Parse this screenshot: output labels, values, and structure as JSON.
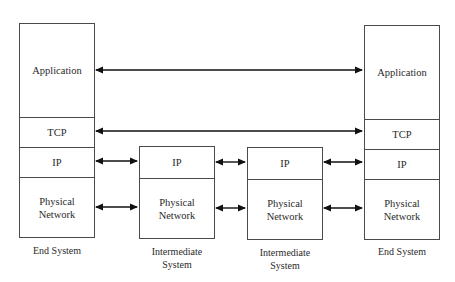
{
  "diagram": {
    "type": "protocol-stack",
    "systems": [
      {
        "id": "end-system-left",
        "label": "End System",
        "layers": [
          "Application",
          "TCP",
          "IP",
          "Physical Network"
        ]
      },
      {
        "id": "intermediate-system-1",
        "label": "Intermediate System",
        "layers": [
          "IP",
          "Physical Network"
        ]
      },
      {
        "id": "intermediate-system-2",
        "label": "Intermediate System",
        "layers": [
          "IP",
          "Physical Network"
        ]
      },
      {
        "id": "end-system-right",
        "label": "End System",
        "layers": [
          "Application",
          "TCP",
          "IP",
          "Physical Network"
        ]
      }
    ],
    "connections": [
      {
        "from": "end-system-left.Application",
        "to": "end-system-right.Application",
        "style": "double-arrow"
      },
      {
        "from": "end-system-left.TCP",
        "to": "end-system-right.TCP",
        "style": "double-arrow"
      },
      {
        "from": "end-system-left.IP",
        "to": "intermediate-system-1.IP",
        "style": "double-arrow"
      },
      {
        "from": "intermediate-system-1.IP",
        "to": "intermediate-system-2.IP",
        "style": "double-arrow"
      },
      {
        "from": "intermediate-system-2.IP",
        "to": "end-system-right.IP",
        "style": "double-arrow"
      },
      {
        "from": "end-system-left.Physical Network",
        "to": "intermediate-system-1.Physical Network",
        "style": "double-arrow"
      },
      {
        "from": "intermediate-system-1.Physical Network",
        "to": "intermediate-system-2.Physical Network",
        "style": "double-arrow"
      },
      {
        "from": "intermediate-system-2.Physical Network",
        "to": "end-system-right.Physical Network",
        "style": "double-arrow"
      }
    ]
  },
  "labels": {
    "left": {
      "application": "Application",
      "tcp": "TCP",
      "ip": "IP",
      "physical_line1": "Physical",
      "physical_line2": "Network",
      "system": "End System"
    },
    "mid1": {
      "ip": "IP",
      "physical_line1": "Physical",
      "physical_line2": "Network",
      "system_line1": "Intermediate",
      "system_line2": "System"
    },
    "mid2": {
      "ip": "IP",
      "physical_line1": "Physical",
      "physical_line2": "Network",
      "system_line1": "Intermediate",
      "system_line2": "System"
    },
    "right": {
      "application": "Application",
      "tcp": "TCP",
      "ip": "IP",
      "physical_line1": "Physical",
      "physical_line2": "Network",
      "system": "End System"
    }
  },
  "colors": {
    "line": "#4a4a4a",
    "arrow": "#111111",
    "text": "#2a2a2a",
    "background": "#ffffff"
  }
}
